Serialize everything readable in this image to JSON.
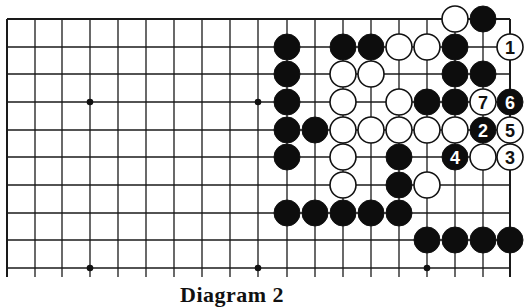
{
  "diagram": {
    "caption": "Diagram 2",
    "board": {
      "columns_x": [
        7,
        35,
        62,
        90,
        118,
        146,
        174,
        202,
        230,
        258,
        287,
        315,
        343,
        371,
        399,
        427,
        455,
        483,
        510
      ],
      "rows_y": [
        19,
        47,
        74,
        102,
        130,
        157,
        185,
        213,
        240,
        268
      ],
      "line_extend_bottom": 277,
      "top_edge": true,
      "left_edge": true,
      "right_edge": true,
      "line_color": "#1a1a1a",
      "stone_radius": 13,
      "hoshi": [
        [
          3,
          3
        ],
        [
          9,
          3
        ],
        [
          3,
          9
        ],
        [
          9,
          9
        ],
        [
          15,
          9
        ]
      ]
    },
    "stones": [
      {
        "c": 16,
        "r": 0,
        "color": "white"
      },
      {
        "c": 17,
        "r": 0,
        "color": "black"
      },
      {
        "c": 10,
        "r": 1,
        "color": "black"
      },
      {
        "c": 12,
        "r": 1,
        "color": "black"
      },
      {
        "c": 13,
        "r": 1,
        "color": "black"
      },
      {
        "c": 14,
        "r": 1,
        "color": "white"
      },
      {
        "c": 15,
        "r": 1,
        "color": "white"
      },
      {
        "c": 16,
        "r": 1,
        "color": "black"
      },
      {
        "c": 18,
        "r": 1,
        "color": "white",
        "label": "1"
      },
      {
        "c": 10,
        "r": 2,
        "color": "black"
      },
      {
        "c": 12,
        "r": 2,
        "color": "white"
      },
      {
        "c": 13,
        "r": 2,
        "color": "white"
      },
      {
        "c": 16,
        "r": 2,
        "color": "black"
      },
      {
        "c": 17,
        "r": 2,
        "color": "black"
      },
      {
        "c": 10,
        "r": 3,
        "color": "black"
      },
      {
        "c": 12,
        "r": 3,
        "color": "white"
      },
      {
        "c": 14,
        "r": 3,
        "color": "white"
      },
      {
        "c": 15,
        "r": 3,
        "color": "black"
      },
      {
        "c": 16,
        "r": 3,
        "color": "black"
      },
      {
        "c": 17,
        "r": 3,
        "color": "white",
        "label": "7"
      },
      {
        "c": 18,
        "r": 3,
        "color": "black",
        "label": "6"
      },
      {
        "c": 10,
        "r": 4,
        "color": "black"
      },
      {
        "c": 11,
        "r": 4,
        "color": "black"
      },
      {
        "c": 12,
        "r": 4,
        "color": "white"
      },
      {
        "c": 13,
        "r": 4,
        "color": "white"
      },
      {
        "c": 14,
        "r": 4,
        "color": "white"
      },
      {
        "c": 15,
        "r": 4,
        "color": "white"
      },
      {
        "c": 16,
        "r": 4,
        "color": "white"
      },
      {
        "c": 17,
        "r": 4,
        "color": "black",
        "label": "2"
      },
      {
        "c": 18,
        "r": 4,
        "color": "white",
        "label": "5"
      },
      {
        "c": 10,
        "r": 5,
        "color": "black"
      },
      {
        "c": 12,
        "r": 5,
        "color": "white"
      },
      {
        "c": 14,
        "r": 5,
        "color": "black"
      },
      {
        "c": 16,
        "r": 5,
        "color": "black",
        "label": "4"
      },
      {
        "c": 17,
        "r": 5,
        "color": "white"
      },
      {
        "c": 18,
        "r": 5,
        "color": "white",
        "label": "3"
      },
      {
        "c": 12,
        "r": 6,
        "color": "white"
      },
      {
        "c": 14,
        "r": 6,
        "color": "black"
      },
      {
        "c": 15,
        "r": 6,
        "color": "white"
      },
      {
        "c": 10,
        "r": 7,
        "color": "black"
      },
      {
        "c": 11,
        "r": 7,
        "color": "black"
      },
      {
        "c": 12,
        "r": 7,
        "color": "black"
      },
      {
        "c": 13,
        "r": 7,
        "color": "black"
      },
      {
        "c": 14,
        "r": 7,
        "color": "black"
      },
      {
        "c": 15,
        "r": 8,
        "color": "black"
      },
      {
        "c": 16,
        "r": 8,
        "color": "black"
      },
      {
        "c": 17,
        "r": 8,
        "color": "black"
      },
      {
        "c": 18,
        "r": 8,
        "color": "black"
      }
    ]
  }
}
